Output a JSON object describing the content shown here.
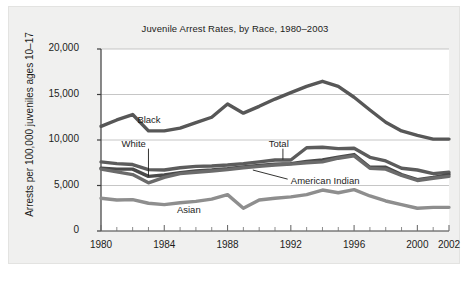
{
  "chart_data": {
    "type": "line",
    "title": "Juvenile Arrest Rates, by Race, 1980–2003",
    "xlabel": "",
    "ylabel": "Arrests per 100,000 juveniles ages 10–17",
    "xlim": [
      1980,
      2002
    ],
    "ylim": [
      0,
      20000
    ],
    "grid": true,
    "legend_position": "inline-annotations",
    "x": [
      1980,
      1981,
      1982,
      1983,
      1984,
      1985,
      1986,
      1987,
      1988,
      1989,
      1990,
      1991,
      1992,
      1993,
      1994,
      1995,
      1996,
      1997,
      1998,
      1999,
      2000,
      2001,
      2002
    ],
    "ytick_labels": [
      "0",
      "5,000",
      "10,000",
      "15,000",
      "20,000"
    ],
    "ytick_values": [
      0,
      5000,
      10000,
      15000,
      20000
    ],
    "xtick_labels": [
      "1980",
      "1984",
      "1988",
      "1992",
      "1996",
      "2000",
      "2002"
    ],
    "xtick_values": [
      1980,
      1984,
      1988,
      1992,
      1996,
      2000,
      2002
    ],
    "series": [
      {
        "name": "Black",
        "color": "#575757",
        "label_text": "Black",
        "values": [
          11500,
          12200,
          12800,
          11000,
          11000,
          11300,
          11900,
          12500,
          13950,
          12950,
          13700,
          14500,
          15200,
          15900,
          16450,
          15900,
          14700,
          13300,
          11950,
          11000,
          10500,
          10100,
          10100
        ]
      },
      {
        "name": "Total",
        "color": "#5c5c5c",
        "label_text": "Total",
        "values": [
          7600,
          7400,
          7300,
          6750,
          6700,
          6950,
          7100,
          7150,
          7250,
          7400,
          7600,
          7800,
          7800,
          9150,
          9200,
          9050,
          9100,
          8100,
          7700,
          6900,
          6700,
          6300,
          6450
        ]
      },
      {
        "name": "White",
        "color": "#4a4a4a",
        "label_text": "White",
        "values": [
          6900,
          6800,
          6800,
          6000,
          6150,
          6400,
          6600,
          6700,
          6850,
          7050,
          7200,
          7350,
          7400,
          7650,
          7800,
          8100,
          8400,
          7000,
          7000,
          6200,
          5650,
          5900,
          6200
        ]
      },
      {
        "name": "American Indian",
        "color": "#6b6b6b",
        "label_text": "American Indian",
        "values": [
          6800,
          6500,
          6200,
          5300,
          5900,
          6300,
          6450,
          6600,
          6750,
          6950,
          7100,
          7250,
          7350,
          7500,
          7600,
          8000,
          8250,
          6900,
          6800,
          6100,
          5550,
          5800,
          6000
        ]
      },
      {
        "name": "Asian",
        "color": "#8e8e8e",
        "label_text": "Asian",
        "values": [
          3600,
          3400,
          3450,
          3050,
          2900,
          3100,
          3250,
          3500,
          4000,
          2500,
          3400,
          3600,
          3750,
          4000,
          4500,
          4200,
          4550,
          3850,
          3300,
          2900,
          2500,
          2600,
          2600
        ]
      }
    ],
    "annotations": [
      {
        "name": "black-label",
        "text": "Black",
        "x": 1982.3,
        "y": 12100,
        "leader": false
      },
      {
        "name": "white-label",
        "text": "White",
        "x": 1981.3,
        "y": 9450,
        "leader": true,
        "leader_from": [
          1983.0,
          9050
        ],
        "leader_to": [
          1983.0,
          6000
        ]
      },
      {
        "name": "total-label",
        "text": "Total",
        "x": 1990.6,
        "y": 9450,
        "leader": true,
        "leader_from": [
          1991.5,
          9050
        ],
        "leader_to": [
          1991.5,
          7850
        ]
      },
      {
        "name": "american-indian-label",
        "text": "American Indian",
        "x": 1992.0,
        "y": 5350,
        "leader": true,
        "leader_from": [
          1991.8,
          5700
        ],
        "leader_to": [
          1989.6,
          6700
        ]
      },
      {
        "name": "asian-label",
        "text": "Asian",
        "x": 1984.8,
        "y": 2200,
        "leader": false
      }
    ]
  }
}
